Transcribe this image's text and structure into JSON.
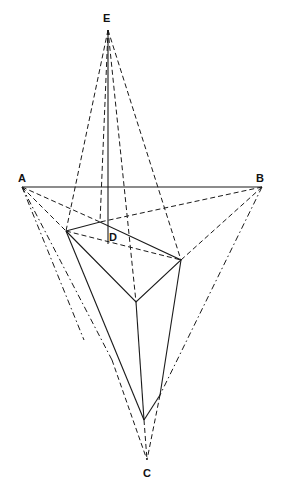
{
  "diagram": {
    "labels": {
      "E": "E",
      "A": "A",
      "B": "B",
      "C": "C",
      "D": "D"
    },
    "points": {
      "E": [
        108,
        28
      ],
      "A": [
        22,
        187
      ],
      "B": [
        262,
        187
      ],
      "C": [
        147,
        460
      ],
      "D": [
        108,
        244
      ],
      "P1": [
        66,
        231
      ],
      "P2": [
        100,
        222
      ],
      "P3": [
        181,
        260
      ],
      "P4": [
        136,
        302
      ],
      "P5": [
        144,
        420
      ],
      "P6": [
        160,
        395
      ]
    },
    "colors": {
      "line": "#1a1a1a",
      "background": "#ffffff"
    }
  }
}
